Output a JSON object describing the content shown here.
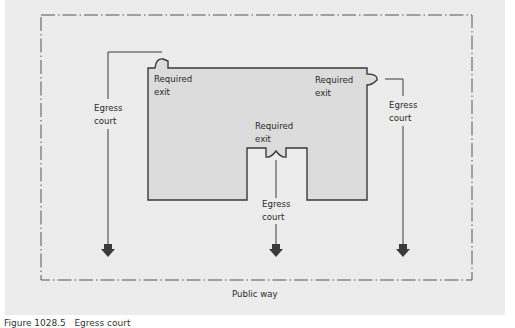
{
  "diagram": {
    "type": "site-plan",
    "labels": {
      "exit_top_left": "Required\nexit",
      "exit_top_right": "Required\nexit",
      "exit_center": "Required\nexit",
      "court_left": "Egress\ncourt",
      "court_right": "Egress\ncourt",
      "court_center": "Egress\ncourt",
      "public_way": "Public way"
    },
    "caption": "Figure 1028.5   Egress court",
    "colors": {
      "background": "#ececec",
      "building_fill": "#dcdcdc",
      "line": "#3a3a3a",
      "boundary": "#555555"
    }
  }
}
